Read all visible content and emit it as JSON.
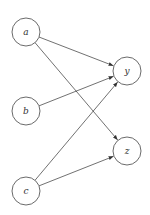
{
  "diagram": {
    "type": "directed-graph",
    "nodes": [
      {
        "id": "a",
        "label": "a",
        "cx": 26,
        "cy": 32
      },
      {
        "id": "b",
        "label": "b",
        "cx": 26,
        "cy": 111
      },
      {
        "id": "c",
        "label": "c",
        "cx": 26,
        "cy": 191
      },
      {
        "id": "y",
        "label": "y",
        "cx": 127,
        "cy": 71
      },
      {
        "id": "z",
        "label": "z",
        "cx": 127,
        "cy": 151
      }
    ],
    "edges": [
      {
        "from": "a",
        "to": "y"
      },
      {
        "from": "a",
        "to": "z"
      },
      {
        "from": "b",
        "to": "y"
      },
      {
        "from": "c",
        "to": "y"
      },
      {
        "from": "c",
        "to": "z"
      }
    ],
    "node_radius": 14,
    "colors": {
      "stroke": "#444444",
      "background": "#ffffff"
    }
  }
}
